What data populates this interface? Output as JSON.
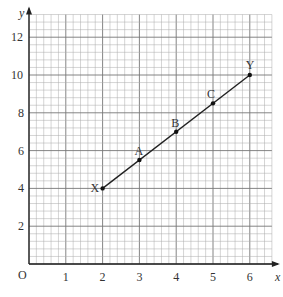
{
  "chart_data": {
    "type": "line",
    "title": "",
    "xlabel": "x",
    "ylabel": "y",
    "origin_label": "O",
    "xlim": [
      0,
      6.6
    ],
    "ylim": [
      0,
      13.2
    ],
    "x_ticks": [
      1,
      2,
      3,
      4,
      5,
      6
    ],
    "y_ticks": [
      2,
      4,
      6,
      8,
      10,
      12
    ],
    "grid": true,
    "series": [
      {
        "name": "XY",
        "points": [
          {
            "label": "X",
            "x": 2,
            "y": 4
          },
          {
            "label": "A",
            "x": 3,
            "y": 5.5
          },
          {
            "label": "B",
            "x": 4,
            "y": 7
          },
          {
            "label": "C",
            "x": 5,
            "y": 8.5
          },
          {
            "label": "Y",
            "x": 6,
            "y": 10
          }
        ]
      }
    ]
  }
}
